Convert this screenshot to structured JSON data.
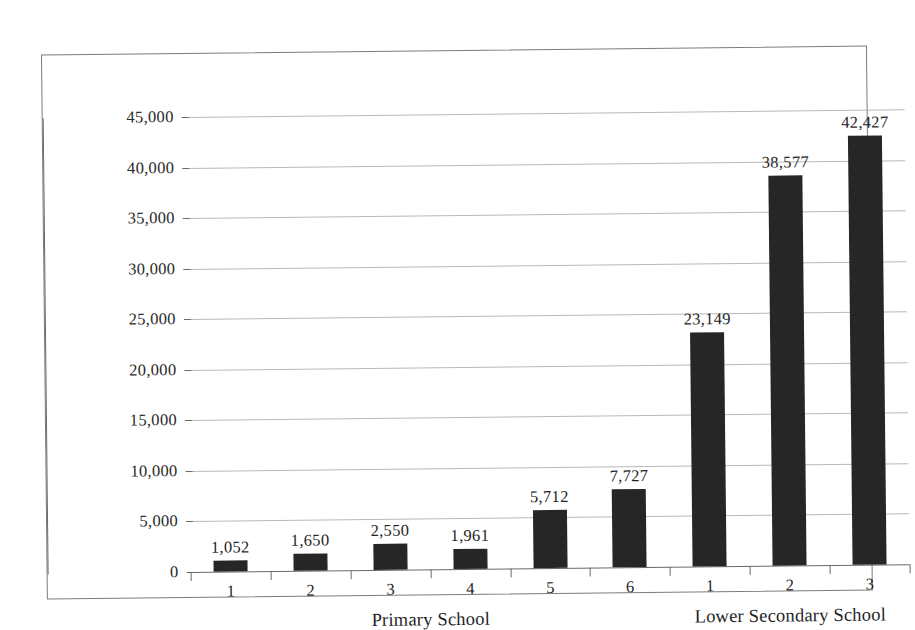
{
  "chart_data": {
    "type": "bar",
    "title": "",
    "subtitle": "",
    "xlabel": "",
    "ylabel": "",
    "ylim": [
      0,
      45000
    ],
    "ytick_step": 5000,
    "grid": true,
    "legend": null,
    "bar_color": "#262626",
    "categories": [
      "1",
      "2",
      "3",
      "4",
      "5",
      "6",
      "1",
      "2",
      "3"
    ],
    "values": [
      1052,
      1650,
      2550,
      1961,
      5712,
      7727,
      23149,
      38577,
      42427
    ],
    "data_labels": [
      "1,052",
      "1,650",
      "2,550",
      "1,961",
      "5,712",
      "7,727",
      "23,149",
      "38,577",
      "42,427"
    ],
    "ytick_labels": [
      "0",
      "5,000",
      "10,000",
      "15,000",
      "20,000",
      "25,000",
      "30,000",
      "35,000",
      "40,000",
      "45,000"
    ],
    "ytick_values": [
      0,
      5000,
      10000,
      15000,
      20000,
      25000,
      30000,
      35000,
      40000,
      45000
    ],
    "groups": [
      {
        "label": "Primary School",
        "categories": [
          "1",
          "2",
          "3",
          "4",
          "5",
          "6"
        ]
      },
      {
        "label": "Lower Secondary School",
        "categories": [
          "1",
          "2",
          "3"
        ]
      }
    ]
  },
  "axis": {
    "y": {
      "t0": "0",
      "t1": "5,000",
      "t2": "10,000",
      "t3": "15,000",
      "t4": "20,000",
      "t5": "25,000",
      "t6": "30,000",
      "t7": "35,000",
      "t8": "40,000",
      "t9": "45,000"
    },
    "x": {
      "c0": "1",
      "c1": "2",
      "c2": "3",
      "c3": "4",
      "c4": "5",
      "c5": "6",
      "c6": "1",
      "c7": "2",
      "c8": "3"
    }
  },
  "labels": {
    "v0": "1,052",
    "v1": "1,650",
    "v2": "2,550",
    "v3": "1,961",
    "v4": "5,712",
    "v5": "7,727",
    "v6": "23,149",
    "v7": "38,577",
    "v8": "42,427"
  },
  "groups": {
    "primary": "Primary School",
    "lower_secondary": "Lower Secondary School"
  }
}
